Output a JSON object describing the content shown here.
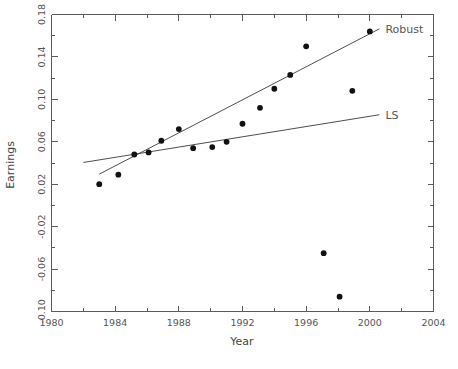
{
  "chart_data": {
    "type": "scatter",
    "title": "",
    "xlabel": "Year",
    "ylabel": "Earnings",
    "xlim": [
      1980,
      2004
    ],
    "ylim": [
      -0.1,
      0.18
    ],
    "grid": false,
    "legend_position": "right-inline",
    "xticks": [
      1980,
      1984,
      1988,
      1992,
      1996,
      2000,
      2004
    ],
    "xtick_labels": [
      "1980",
      "1984",
      "1988",
      "1992",
      "1996",
      "2000",
      "2004"
    ],
    "xminor_ticks": [
      1982,
      1986,
      1990,
      1994,
      1998,
      2002
    ],
    "yticks": [
      -0.1,
      -0.06,
      -0.02,
      0.02,
      0.06,
      0.1,
      0.14,
      0.18
    ],
    "ytick_labels": [
      "-0.10",
      "-0.06",
      "-0.02",
      "0.02",
      "0.06",
      "0.10",
      "0.14",
      "0.18"
    ],
    "yminor_ticks": [
      -0.08,
      -0.04,
      0.0,
      0.04,
      0.08,
      0.12,
      0.16
    ],
    "points": [
      {
        "x": 1983.0,
        "y": 0.02
      },
      {
        "x": 1984.2,
        "y": 0.029
      },
      {
        "x": 1985.2,
        "y": 0.048
      },
      {
        "x": 1986.1,
        "y": 0.05
      },
      {
        "x": 1986.9,
        "y": 0.061
      },
      {
        "x": 1988.0,
        "y": 0.072
      },
      {
        "x": 1988.9,
        "y": 0.054
      },
      {
        "x": 1990.1,
        "y": 0.055
      },
      {
        "x": 1991.0,
        "y": 0.06
      },
      {
        "x": 1992.0,
        "y": 0.077
      },
      {
        "x": 1993.1,
        "y": 0.092
      },
      {
        "x": 1994.0,
        "y": 0.11
      },
      {
        "x": 1995.0,
        "y": 0.123
      },
      {
        "x": 1996.0,
        "y": 0.15
      },
      {
        "x": 1997.1,
        "y": -0.045
      },
      {
        "x": 1998.1,
        "y": -0.086
      },
      {
        "x": 1998.9,
        "y": 0.108
      },
      {
        "x": 2000.0,
        "y": 0.164
      }
    ],
    "series": [
      {
        "name": "Robust",
        "type": "line",
        "label": "Robust",
        "x": [
          1983.0,
          2000.6
        ],
        "y": [
          0.0295,
          0.1665
        ]
      },
      {
        "name": "LS",
        "type": "line",
        "label": "LS",
        "x": [
          1982.0,
          2000.6
        ],
        "y": [
          0.0405,
          0.0855
        ]
      }
    ]
  },
  "labels": {
    "x_axis_title": "Year",
    "y_axis_title": "Earnings",
    "robust_label": "Robust",
    "ls_label": "LS"
  }
}
